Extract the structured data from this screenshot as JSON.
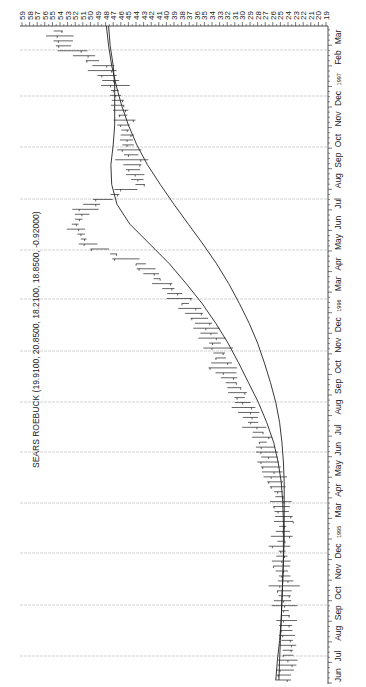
{
  "title": "SEARS ROEBUCK (19.9100, 20.8500, 18.2100, 18.8500, -0.92000)",
  "chart_data": {
    "type": "line",
    "orientation": "rotated-90-clockwise",
    "title": "SEARS ROEBUCK (19.9100, 20.8500, 18.2100, 18.8500, -0.92000)",
    "ohlc_header": {
      "open": 19.91,
      "high": 20.85,
      "low": 18.21,
      "close": 18.85,
      "change": -0.92
    },
    "xlabel": "",
    "ylabel": "",
    "price_axis_ticks": [
      59,
      58,
      57,
      56,
      55,
      54,
      53,
      52,
      51,
      50,
      49,
      48,
      47,
      46,
      45,
      44,
      43,
      42,
      41,
      40,
      39,
      38,
      37,
      36,
      35,
      34,
      33,
      32,
      31,
      30,
      29,
      28,
      27,
      26,
      25,
      24,
      23,
      22,
      21,
      20,
      19
    ],
    "ylim": [
      19,
      59
    ],
    "time_axis_labels": [
      "Jun",
      "Jul",
      "Aug",
      "Sep",
      "Oct",
      "Nov",
      "Dec",
      "1995",
      "Mar",
      "Apr",
      "May",
      "Jun",
      "Jul",
      "Aug",
      "Sep",
      "Oct",
      "Nov",
      "Dec",
      "1996",
      "Mar",
      "Apr",
      "May",
      "Jun",
      "Jul",
      "Aug",
      "Sep",
      "Oct",
      "Nov",
      "Dec",
      "1997",
      "Feb",
      "Mar"
    ],
    "grid": true,
    "x": [
      "Jun",
      "Jul",
      "Aug",
      "Sep",
      "Oct",
      "Nov",
      "Dec",
      "Jan",
      "Feb",
      "Mar",
      "Apr",
      "May",
      "Jun",
      "Jul",
      "Aug",
      "Sep",
      "Oct",
      "Nov",
      "Dec",
      "Jan",
      "Feb",
      "Mar",
      "Apr",
      "May",
      "Jun",
      "Jul",
      "Aug",
      "Sep",
      "Oct",
      "Nov",
      "Dec",
      "Jan",
      "Feb",
      "Mar"
    ],
    "series": [
      {
        "name": "Price (bars, approx mid)",
        "style": "ohlc-bars",
        "values": [
          24.5,
          24.2,
          24.0,
          24.3,
          24.6,
          24.4,
          24.8,
          24.9,
          24.6,
          24.8,
          25.6,
          26.5,
          27.3,
          28.5,
          30.0,
          31.5,
          32.6,
          33.5,
          35.0,
          37.5,
          40.5,
          43.5,
          50.5,
          52.0,
          50.0,
          43.5,
          44.5,
          45.0,
          45.5,
          46.2,
          47.0,
          48.5,
          53.5,
          54.5
        ]
      },
      {
        "name": "Moving average (short)",
        "style": "line",
        "values": [
          25.6,
          25.4,
          25.1,
          24.9,
          24.8,
          24.7,
          24.6,
          24.6,
          24.6,
          24.7,
          24.9,
          25.3,
          25.9,
          26.8,
          27.9,
          29.2,
          30.5,
          31.9,
          33.5,
          35.3,
          37.4,
          39.6,
          42.2,
          44.8,
          46.5,
          47.2,
          47.3,
          47.0,
          46.8,
          46.8,
          46.8,
          47.0,
          47.4,
          47.6
        ]
      },
      {
        "name": "Moving average (long)",
        "style": "line",
        "values": [
          25.2,
          25.1,
          25.0,
          24.9,
          24.8,
          24.7,
          24.6,
          24.5,
          24.5,
          24.5,
          24.5,
          24.6,
          24.8,
          25.1,
          25.6,
          26.3,
          27.1,
          28.0,
          29.1,
          30.4,
          31.8,
          33.4,
          35.2,
          37.1,
          39.0,
          40.8,
          42.5,
          43.9,
          45.0,
          45.9,
          46.6,
          47.2,
          47.6,
          47.9
        ]
      }
    ]
  },
  "colors": {
    "background": "#ffffff",
    "ink": "#222222",
    "grid": "#bdbdbd"
  }
}
